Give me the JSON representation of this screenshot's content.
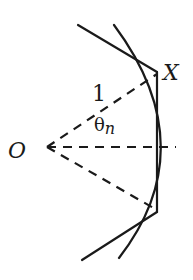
{
  "labels": {
    "origin": "O",
    "point": "X",
    "radius": "1",
    "angle_symbol": "θ",
    "angle_subscript": "n"
  },
  "colors": {
    "stroke": "#1a1a1a",
    "background": "#ffffff"
  }
}
